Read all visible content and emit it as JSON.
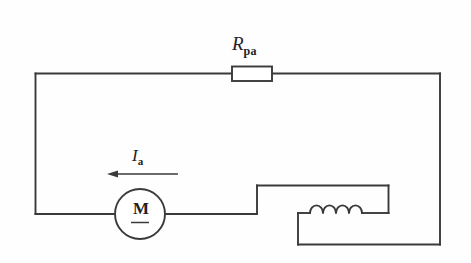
{
  "figure": {
    "type": "schematic-circuit-diagram",
    "background_color": "#fefefe",
    "line_color": "#3a3a3c",
    "width": 471,
    "height": 263
  },
  "labels": {
    "resistor": {
      "symbol": "R",
      "subscript": "pa",
      "full": "Rpa",
      "meaning": "series armature resistance"
    },
    "current": {
      "symbol": "I",
      "subscript": "a",
      "full": "Ia",
      "meaning": "armature current",
      "arrow_direction": "left"
    },
    "motor": {
      "symbol": "M",
      "meaning": "dc motor armature",
      "has_underline": true
    },
    "inductor": {
      "symbol": "",
      "meaning": "field winding coil",
      "turns": 4
    }
  },
  "components": [
    {
      "name": "resistor",
      "label": "Rpa",
      "position": "top-wire-center"
    },
    {
      "name": "motor",
      "label": "M",
      "position": "lower-left"
    },
    {
      "name": "field-coil",
      "label": "",
      "position": "lower-right"
    },
    {
      "name": "current-arrow",
      "label": "Ia",
      "position": "above-motor"
    }
  ],
  "geometry": {
    "outer_loop": {
      "left": 35,
      "top": 73,
      "right": 440,
      "bottom": 245
    },
    "resistor_box": {
      "x": 232,
      "y": 68,
      "width": 40,
      "height": 15
    },
    "motor_circle": {
      "cx": 140,
      "cy": 214,
      "r": 25
    },
    "coil": {
      "x_start": 310,
      "x_end": 362,
      "y_baseline": 213,
      "turns": 4
    },
    "arrow": {
      "x_from": 178,
      "x_to": 108,
      "y": 174
    }
  }
}
